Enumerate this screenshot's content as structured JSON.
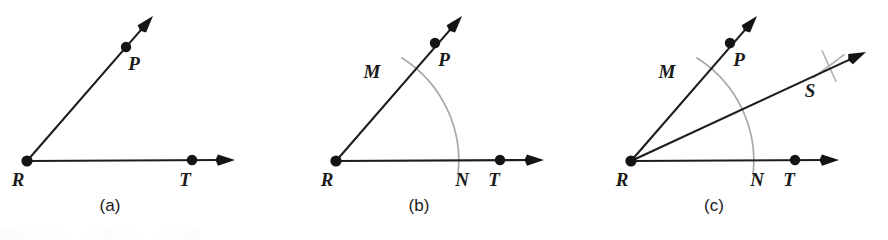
{
  "figure": {
    "background_color": "#ffffff",
    "line_color": "#1d1d1d",
    "arc_color": "#a8a8a8",
    "label_color": "#1a1a1a"
  },
  "panels": [
    {
      "id": "a",
      "caption": "(a)",
      "caption_pos": {
        "x": 110,
        "y": 211
      },
      "vertex": {
        "label": "R",
        "x": 27,
        "y": 161,
        "label_x": 18,
        "label_y": 186
      },
      "points": [
        {
          "label": "P",
          "x": 126,
          "y": 47,
          "label_x": 134,
          "label_y": 70
        },
        {
          "label": "T",
          "x": 192,
          "y": 160,
          "label_x": 185,
          "label_y": 186
        }
      ],
      "rays": [
        {
          "name": "ray-RP",
          "x1": 27,
          "y1": 161,
          "x2": 153,
          "y2": 16
        },
        {
          "name": "ray-RT",
          "x1": 27,
          "y1": 161,
          "x2": 235,
          "y2": 160
        }
      ],
      "arcs": [],
      "crosses": []
    },
    {
      "id": "b",
      "caption": "(b)",
      "caption_pos": {
        "x": 419,
        "y": 211
      },
      "vertex": {
        "label": "R",
        "x": 336,
        "y": 161,
        "label_x": 327,
        "label_y": 186
      },
      "points": [
        {
          "label": "P",
          "x": 435,
          "y": 43,
          "label_x": 444,
          "label_y": 66
        },
        {
          "label": "T",
          "x": 500,
          "y": 160,
          "label_x": 494,
          "label_y": 186
        },
        {
          "label": "M",
          "x": 406,
          "y": 62,
          "label_x": 372,
          "label_y": 78
        },
        {
          "label": "N",
          "x": 457,
          "y": 161,
          "label_x": 462,
          "label_y": 186
        }
      ],
      "rays": [
        {
          "name": "ray-RP",
          "x1": 336,
          "y1": 161,
          "x2": 462,
          "y2": 16
        },
        {
          "name": "ray-RT",
          "x1": 336,
          "y1": 161,
          "x2": 544,
          "y2": 160
        }
      ],
      "arcs": [
        {
          "name": "construction-arc",
          "cx": 336,
          "cy": 161,
          "r": 122,
          "start_x": 402,
          "start_y": 58,
          "end_x": 458,
          "end_y": 175
        }
      ],
      "crosses": []
    },
    {
      "id": "c",
      "caption": "(c)",
      "caption_pos": {
        "x": 714,
        "y": 211
      },
      "vertex": {
        "label": "R",
        "x": 631,
        "y": 161,
        "label_x": 622,
        "label_y": 186
      },
      "points": [
        {
          "label": "P",
          "x": 730,
          "y": 43,
          "label_x": 739,
          "label_y": 66
        },
        {
          "label": "T",
          "x": 795,
          "y": 160,
          "label_x": 789,
          "label_y": 186
        },
        {
          "label": "M",
          "x": 701,
          "y": 62,
          "label_x": 667,
          "label_y": 78
        },
        {
          "label": "N",
          "x": 752,
          "y": 161,
          "label_x": 757,
          "label_y": 186
        },
        {
          "label": "S",
          "x": 828,
          "y": 66,
          "label_x": 810,
          "label_y": 97
        }
      ],
      "rays": [
        {
          "name": "ray-RP",
          "x1": 631,
          "y1": 161,
          "x2": 757,
          "y2": 16
        },
        {
          "name": "ray-RT",
          "x1": 631,
          "y1": 161,
          "x2": 839,
          "y2": 160
        },
        {
          "name": "ray-RS-bisector",
          "x1": 631,
          "y1": 161,
          "x2": 866,
          "y2": 52
        }
      ],
      "arcs": [
        {
          "name": "construction-arc",
          "cx": 631,
          "cy": 161,
          "r": 122,
          "start_x": 697,
          "start_y": 58,
          "end_x": 753,
          "end_y": 175
        }
      ],
      "crosses": [
        {
          "name": "arc-intersection-cross",
          "cx": 829,
          "cy": 66,
          "size": 15
        }
      ]
    }
  ]
}
